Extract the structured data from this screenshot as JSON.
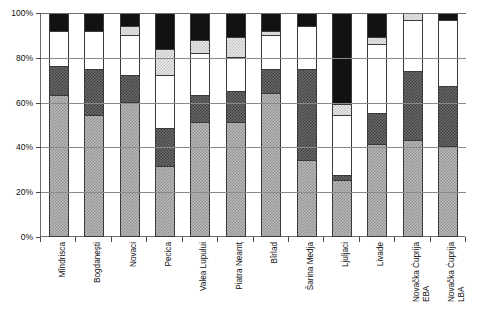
{
  "chart_data": {
    "type": "bar",
    "subtype": "stacked-100-percent",
    "title": "",
    "xlabel": "",
    "ylabel": "",
    "ylim": [
      0,
      100
    ],
    "y_unit": "%",
    "grid": true,
    "legend_position": "none",
    "yticks": [
      "0%",
      "20%",
      "40%",
      "60%",
      "80%",
      "100%"
    ],
    "ytick_values": [
      0,
      20,
      40,
      60,
      80,
      100
    ],
    "categories": [
      "Mîndrisca",
      "Bogdanești",
      "Novaci",
      "Pecica",
      "Valea Lupului",
      "Piatra Neamț",
      "Bîrlad",
      "Šarina Medja",
      "Ljuljaci",
      "Livade",
      "Novačka Ćuprija EBA",
      "Novačka Ćuprija LBA"
    ],
    "category_lines": [
      [
        "Mîndrisca",
        ""
      ],
      [
        "Bogdanești",
        ""
      ],
      [
        "Novaci",
        ""
      ],
      [
        "Pecica",
        ""
      ],
      [
        "Valea Lupului",
        ""
      ],
      [
        "Piatra Neamț",
        ""
      ],
      [
        "Bîrlad",
        ""
      ],
      [
        "Šarina Medja",
        ""
      ],
      [
        "Ljuljaci",
        ""
      ],
      [
        "Livade",
        ""
      ],
      [
        "Novačka Ćuprija",
        "EBA"
      ],
      [
        "Novačka Ćuprija",
        "LBA"
      ]
    ],
    "series": [
      {
        "name": "series-1",
        "pattern": "medium-gray-dither",
        "color": "#b9b9b9",
        "values": [
          63,
          54,
          60,
          31,
          51,
          51,
          64,
          34,
          25,
          41,
          43,
          40
        ]
      },
      {
        "name": "series-2",
        "pattern": "dark-gray-dither",
        "color": "#6a6a6a",
        "values": [
          13,
          21,
          12,
          17,
          12,
          14,
          11,
          41,
          2,
          14,
          31,
          27
        ]
      },
      {
        "name": "series-3",
        "pattern": "white",
        "color": "#ffffff",
        "values": [
          16,
          17,
          18,
          24,
          19,
          15,
          15,
          19,
          27,
          31,
          23,
          30
        ]
      },
      {
        "name": "series-4",
        "pattern": "light-gray-dither",
        "color": "#e8e8e8",
        "values": [
          0,
          0,
          4,
          12,
          6,
          9,
          2,
          0,
          5,
          3,
          3,
          0
        ]
      },
      {
        "name": "series-5",
        "pattern": "black",
        "color": "#121212",
        "values": [
          8,
          8,
          6,
          16,
          12,
          11,
          8,
          6,
          41,
          11,
          0,
          3
        ]
      }
    ]
  }
}
